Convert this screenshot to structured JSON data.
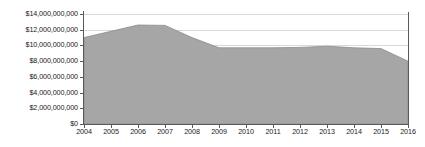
{
  "chart_data": {
    "type": "area",
    "title": "",
    "subtitle": "",
    "xlabel": "",
    "ylabel": "",
    "x": [
      2004,
      2005,
      2006,
      2007,
      2008,
      2009,
      2010,
      2011,
      2012,
      2013,
      2014,
      2015,
      2016
    ],
    "xtick_labels": [
      "2004",
      "2005",
      "2006",
      "2007",
      "2008",
      "2009",
      "2010",
      "2011",
      "2012",
      "2013",
      "2014",
      "2015",
      "2016"
    ],
    "series": [
      {
        "name": "Value",
        "values": [
          11000000000,
          11800000000,
          12600000000,
          12550000000,
          11000000000,
          9700000000,
          9700000000,
          9700000000,
          9750000000,
          9900000000,
          9700000000,
          9600000000,
          8000000000
        ]
      }
    ],
    "ytick_values": [
      0,
      2000000000,
      4000000000,
      6000000000,
      8000000000,
      10000000000,
      12000000000,
      14000000000
    ],
    "ytick_labels": [
      "$0",
      "$2,000,000,000",
      "$4,000,000,000",
      "$6,000,000,000",
      "$8,000,000,000",
      "$10,000,000,000",
      "$12,000,000,000",
      "$14,000,000,000"
    ],
    "ylim": [
      0,
      14000000000
    ],
    "xlim": [
      2004,
      2016
    ],
    "grid": true,
    "legend": false,
    "legend_position": "none",
    "colors": {
      "area_fill": "#a6a6a6",
      "area_edge": "#8c8c8c",
      "gridline": "#d9d9d9",
      "axis": "#595959",
      "text": "#1a1a1a",
      "background": "#ffffff"
    }
  }
}
